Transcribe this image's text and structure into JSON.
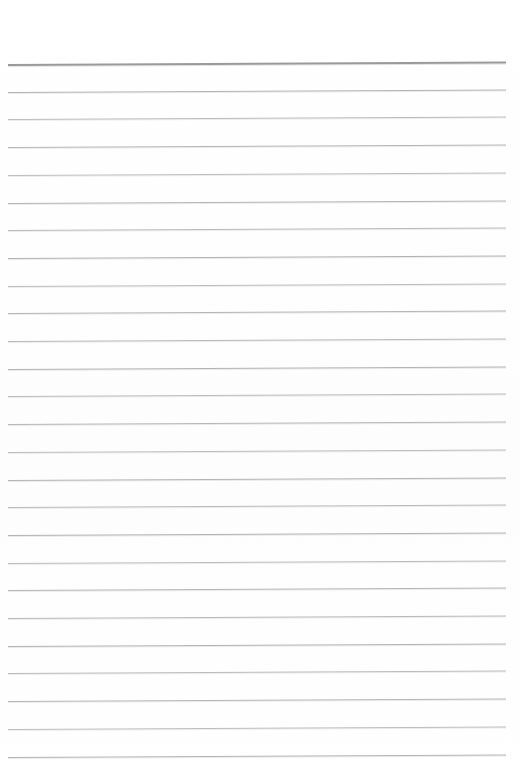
{
  "document": {
    "kind": "scanned-ruled-paper",
    "title": "",
    "body_text": "",
    "visible_text": [],
    "page_width": 520,
    "page_height": 782,
    "background_color": "#fefefe",
    "is_blank": true
  },
  "ruling": {
    "line_count": 26,
    "line_spacing_px": 27.7,
    "first_line_y": 64,
    "left_margin_x": 8,
    "right_margin_x": 506,
    "top_blank_margin_px": 64,
    "bottom_blank_margin_px": 25,
    "skew_rise_px": -2.5,
    "header_rule_color": "#9a9a9a",
    "header_rule_thickness_px": 2,
    "body_rule_color": "#b9b9b9",
    "body_rule_thickness_px": 1,
    "lines": [
      {
        "index": 1,
        "y": 64.0,
        "role": "header-rule",
        "color": "#9a9a9a",
        "thickness": 2
      },
      {
        "index": 2,
        "y": 91.7,
        "role": "body-rule",
        "color": "#b4b4b4",
        "thickness": 1
      },
      {
        "index": 3,
        "y": 119.4,
        "role": "body-rule",
        "color": "#bcbcbc",
        "thickness": 1
      },
      {
        "index": 4,
        "y": 147.1,
        "role": "body-rule",
        "color": "#b6b6b6",
        "thickness": 1
      },
      {
        "index": 5,
        "y": 174.8,
        "role": "body-rule",
        "color": "#bebebe",
        "thickness": 1
      },
      {
        "index": 6,
        "y": 202.5,
        "role": "body-rule",
        "color": "#b5b5b5",
        "thickness": 1
      },
      {
        "index": 7,
        "y": 230.2,
        "role": "body-rule",
        "color": "#bbbbbb",
        "thickness": 1
      },
      {
        "index": 8,
        "y": 257.9,
        "role": "body-rule",
        "color": "#b3b3b3",
        "thickness": 1
      },
      {
        "index": 9,
        "y": 285.6,
        "role": "body-rule",
        "color": "#bdbdbd",
        "thickness": 1
      },
      {
        "index": 10,
        "y": 313.3,
        "role": "body-rule",
        "color": "#b6b6b6",
        "thickness": 1
      },
      {
        "index": 11,
        "y": 341.0,
        "role": "body-rule",
        "color": "#bababa",
        "thickness": 1
      },
      {
        "index": 12,
        "y": 368.7,
        "role": "body-rule",
        "color": "#b4b4b4",
        "thickness": 1
      },
      {
        "index": 13,
        "y": 396.4,
        "role": "body-rule",
        "color": "#bcbcbc",
        "thickness": 1
      },
      {
        "index": 14,
        "y": 424.1,
        "role": "body-rule",
        "color": "#b7b7b7",
        "thickness": 1
      },
      {
        "index": 15,
        "y": 451.8,
        "role": "body-rule",
        "color": "#bebebe",
        "thickness": 1
      },
      {
        "index": 16,
        "y": 479.5,
        "role": "body-rule",
        "color": "#b5b5b5",
        "thickness": 1
      },
      {
        "index": 17,
        "y": 507.2,
        "role": "body-rule",
        "color": "#bbbbbb",
        "thickness": 1
      },
      {
        "index": 18,
        "y": 534.9,
        "role": "body-rule",
        "color": "#b3b3b3",
        "thickness": 1
      },
      {
        "index": 19,
        "y": 562.6,
        "role": "body-rule",
        "color": "#bdbdbd",
        "thickness": 1
      },
      {
        "index": 20,
        "y": 590.3,
        "role": "body-rule",
        "color": "#b6b6b6",
        "thickness": 1
      },
      {
        "index": 21,
        "y": 618.0,
        "role": "body-rule",
        "color": "#bababa",
        "thickness": 1
      },
      {
        "index": 22,
        "y": 645.7,
        "role": "body-rule",
        "color": "#b4b4b4",
        "thickness": 1
      },
      {
        "index": 23,
        "y": 673.4,
        "role": "body-rule",
        "color": "#bcbcbc",
        "thickness": 1
      },
      {
        "index": 24,
        "y": 701.1,
        "role": "body-rule",
        "color": "#b7b7b7",
        "thickness": 1
      },
      {
        "index": 25,
        "y": 728.8,
        "role": "body-rule",
        "color": "#bebebe",
        "thickness": 1
      },
      {
        "index": 26,
        "y": 756.5,
        "role": "body-rule",
        "color": "#b5b5b5",
        "thickness": 1
      }
    ]
  }
}
